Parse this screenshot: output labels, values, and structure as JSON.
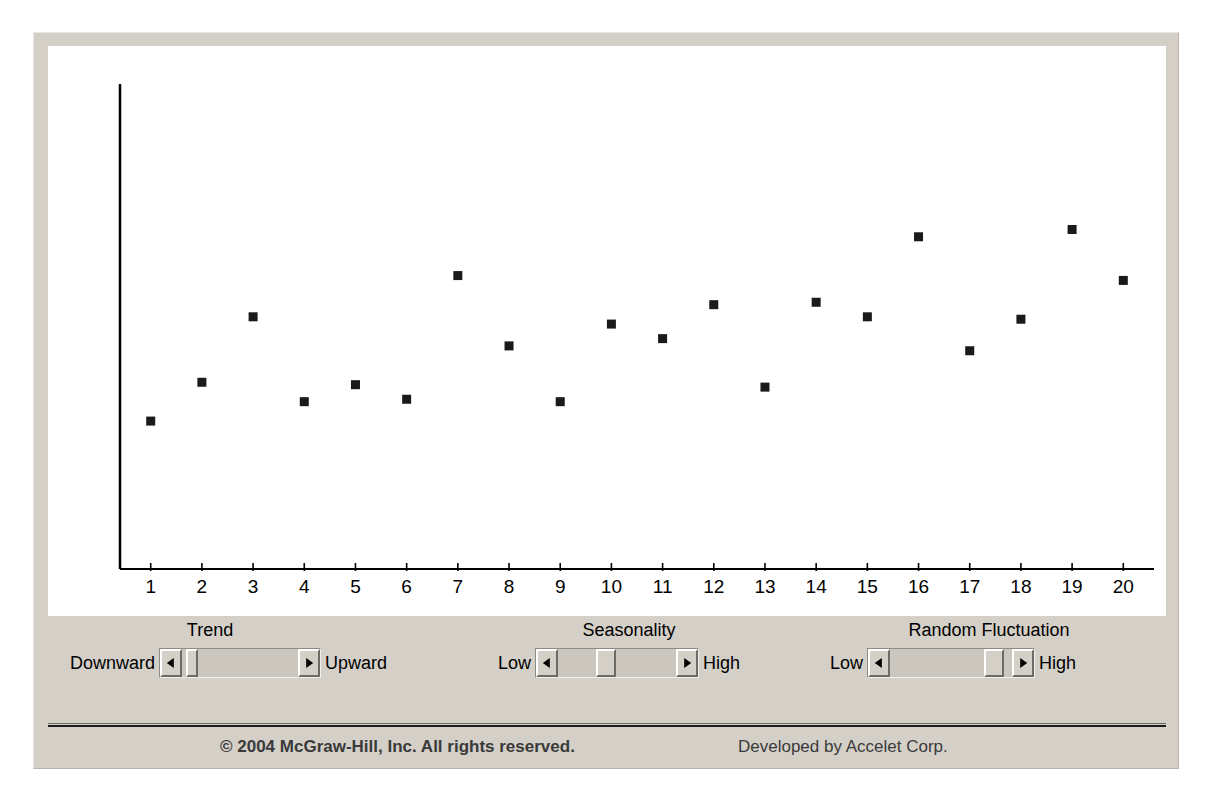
{
  "app": {
    "title": "Time Series Simulation Applet"
  },
  "chart_data": {
    "type": "scatter",
    "title": "",
    "xlabel": "",
    "ylabel": "",
    "x": [
      1,
      2,
      3,
      4,
      5,
      6,
      7,
      8,
      9,
      10,
      11,
      12,
      13,
      14,
      15,
      16,
      17,
      18,
      19,
      20
    ],
    "values": [
      30.5,
      38.5,
      52.0,
      34.5,
      38.0,
      35.0,
      60.5,
      46.0,
      34.5,
      50.5,
      47.5,
      54.5,
      37.5,
      55.0,
      52.0,
      68.5,
      45.0,
      51.5,
      70.0,
      59.5
    ],
    "xtick_labels": [
      "1",
      "2",
      "3",
      "4",
      "5",
      "6",
      "7",
      "8",
      "9",
      "10",
      "11",
      "12",
      "13",
      "14",
      "15",
      "16",
      "17",
      "18",
      "19",
      "20"
    ],
    "xlim": [
      0.4,
      20.6
    ],
    "ylim": [
      0,
      100
    ],
    "grid": false,
    "legend": null,
    "marker": "square",
    "marker_color": "#1a1a1a",
    "axis_color": "#000000",
    "plot_background": "#ffffff",
    "y_axis_visible": true,
    "y_ticks_visible": false
  },
  "controls": {
    "sliders": [
      {
        "name": "trend",
        "title": "Trend",
        "left_label": "Downward",
        "right_label": "Upward",
        "value_percent": 4,
        "left_arrow_icon": "triangle-left-icon",
        "right_arrow_icon": "triangle-right-icon"
      },
      {
        "name": "seasonality",
        "title": "Seasonality",
        "left_label": "Low",
        "right_label": "High",
        "value_percent": 39,
        "left_arrow_icon": "triangle-left-icon",
        "right_arrow_icon": "triangle-right-icon"
      },
      {
        "name": "random-fluctuation",
        "title": "Random Fluctuation",
        "left_label": "Low",
        "right_label": "High",
        "value_percent": 92,
        "left_arrow_icon": "triangle-left-icon",
        "right_arrow_icon": "triangle-right-icon"
      }
    ]
  },
  "footer": {
    "copyright": "© 2004 McGraw-Hill, Inc. All rights reserved.",
    "credit": "Developed by Accelet Corp."
  },
  "colors": {
    "panel_background": "#d4d0c8",
    "plot_background": "#ffffff",
    "marker": "#1a1a1a",
    "axis": "#000000"
  }
}
